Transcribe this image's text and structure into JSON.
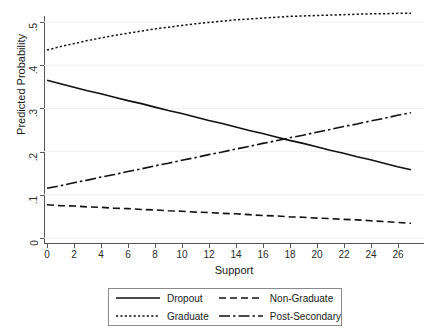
{
  "figure": {
    "cut_title": "",
    "x_axis_title": "Support",
    "y_axis_title": "Predicted Probability"
  },
  "axes": {
    "x_ticks": [
      "0",
      "2",
      "4",
      "6",
      "8",
      "10",
      "12",
      "14",
      "16",
      "18",
      "20",
      "22",
      "24",
      "26"
    ],
    "y_ticks": [
      "0",
      ".1",
      ".2",
      ".3",
      ".4",
      ".5"
    ]
  },
  "legend": {
    "items": [
      {
        "label": "Dropout",
        "style": "solid",
        "key": "line-key-solid"
      },
      {
        "label": "Non-Graduate",
        "style": "dashed",
        "key": "line-key-dashed"
      },
      {
        "label": "Graduate",
        "style": "dotted",
        "key": "line-key-dotted"
      },
      {
        "label": "Post-Secondary",
        "style": "dash-dot",
        "key": "line-key-dash-dot"
      }
    ]
  },
  "chart_data": {
    "type": "line",
    "title": "",
    "xlabel": "Support",
    "ylabel": "Predicted Probability",
    "xlim": [
      0,
      27
    ],
    "ylim": [
      0,
      0.54
    ],
    "xticks": [
      0,
      2,
      4,
      6,
      8,
      10,
      12,
      14,
      16,
      18,
      20,
      22,
      24,
      26
    ],
    "yticks": [
      0,
      0.1,
      0.2,
      0.3,
      0.4,
      0.5
    ],
    "grid": "faint-horizontal",
    "legend_position": "below-axes",
    "x": [
      0,
      1,
      2,
      3,
      4,
      5,
      6,
      7,
      8,
      9,
      10,
      11,
      12,
      13,
      14,
      15,
      16,
      17,
      18,
      19,
      20,
      21,
      22,
      23,
      24,
      25,
      26,
      27
    ],
    "series": [
      {
        "name": "Dropout",
        "style": "solid",
        "values": [
          0.365,
          0.357,
          0.349,
          0.341,
          0.334,
          0.326,
          0.318,
          0.311,
          0.303,
          0.295,
          0.288,
          0.28,
          0.272,
          0.265,
          0.257,
          0.249,
          0.242,
          0.234,
          0.226,
          0.219,
          0.211,
          0.203,
          0.196,
          0.188,
          0.181,
          0.173,
          0.165,
          0.158
        ]
      },
      {
        "name": "Non-Graduate",
        "style": "dashed",
        "values": [
          0.077,
          0.075,
          0.074,
          0.072,
          0.071,
          0.069,
          0.068,
          0.066,
          0.065,
          0.063,
          0.062,
          0.06,
          0.059,
          0.057,
          0.056,
          0.054,
          0.052,
          0.051,
          0.049,
          0.048,
          0.046,
          0.045,
          0.043,
          0.042,
          0.04,
          0.038,
          0.036,
          0.034
        ]
      },
      {
        "name": "Graduate",
        "style": "dotted",
        "values": [
          0.435,
          0.443,
          0.45,
          0.457,
          0.463,
          0.469,
          0.474,
          0.479,
          0.484,
          0.488,
          0.492,
          0.496,
          0.499,
          0.502,
          0.505,
          0.507,
          0.509,
          0.511,
          0.513,
          0.514,
          0.515,
          0.516,
          0.517,
          0.518,
          0.519,
          0.519,
          0.52,
          0.52
        ]
      },
      {
        "name": "Post-Secondary",
        "style": "dash-dot",
        "values": [
          0.115,
          0.121,
          0.128,
          0.134,
          0.141,
          0.147,
          0.154,
          0.16,
          0.167,
          0.173,
          0.18,
          0.186,
          0.193,
          0.199,
          0.206,
          0.212,
          0.219,
          0.225,
          0.232,
          0.238,
          0.245,
          0.251,
          0.258,
          0.264,
          0.271,
          0.277,
          0.284,
          0.29
        ]
      }
    ],
    "annotations": [
      {
        "text": "Dropout and Post-Secondary cross",
        "x": 18,
        "y": 0.22
      }
    ]
  }
}
